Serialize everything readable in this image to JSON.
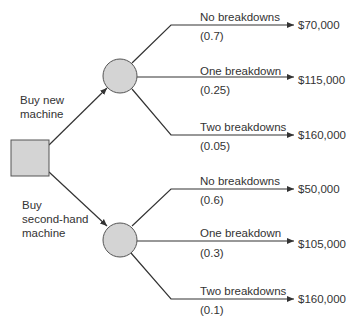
{
  "diagram": {
    "type": "decision-tree",
    "colors": {
      "node_fill": "#d4d4d4",
      "node_stroke": "#555555",
      "line": "#333333"
    },
    "decision_node": {
      "shape": "square"
    },
    "options": [
      {
        "label_line1": "Buy new",
        "label_line2": "machine",
        "chance_node": "circle",
        "outcomes": [
          {
            "event": "No breakdowns",
            "probability": "(0.7)",
            "value": "$70,000"
          },
          {
            "event": "One breakdown",
            "probability": "(0.25)",
            "value": "$115,000"
          },
          {
            "event": "Two breakdowns",
            "probability": "(0.05)",
            "value": "$160,000"
          }
        ]
      },
      {
        "label_line1": "Buy",
        "label_line2": "second-hand",
        "label_line3": "machine",
        "chance_node": "circle",
        "outcomes": [
          {
            "event": "No breakdowns",
            "probability": "(0.6)",
            "value": "$50,000"
          },
          {
            "event": "One breakdown",
            "probability": "(0.3)",
            "value": "$105,000"
          },
          {
            "event": "Two breakdowns",
            "probability": "(0.1)",
            "value": "$160,000"
          }
        ]
      }
    ]
  }
}
